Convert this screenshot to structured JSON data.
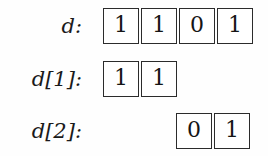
{
  "figure": {
    "background_color": "#fefefe",
    "border_color": "#2b2b2b",
    "text_color": "#1a1a1a",
    "rows": [
      {
        "label": "d:",
        "alignment": "left",
        "cells": [
          "1",
          "1",
          "0",
          "1"
        ]
      },
      {
        "label": "d[1]:",
        "alignment": "left",
        "cells": [
          "1",
          "1"
        ]
      },
      {
        "label": "d[2]:",
        "alignment": "right",
        "cells": [
          "0",
          "1"
        ]
      }
    ]
  }
}
